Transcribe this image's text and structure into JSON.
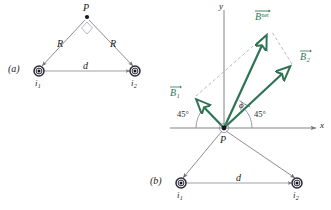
{
  "figure": {
    "panels": [
      {
        "id": "a",
        "label": "(a)",
        "point_label": "P",
        "distance_label": "d",
        "radius_label_left": "R",
        "radius_label_right": "R",
        "current_left": "i",
        "current_left_sub": "1",
        "current_right": "i",
        "current_right_sub": "2"
      },
      {
        "id": "b",
        "label": "(b)",
        "point_label": "P",
        "distance_label": "d",
        "current_left": "i",
        "current_left_sub": "1",
        "current_right": "i",
        "current_right_sub": "2",
        "axis_x": "x",
        "axis_y": "y",
        "angle_left": "45°",
        "angle_right": "45°",
        "angle_phi": "ϕ",
        "vectors": [
          {
            "name": "B",
            "sub": "1",
            "sup": "",
            "label_full": "B1"
          },
          {
            "name": "B",
            "sub": "2",
            "sup": "",
            "label_full": "B2"
          },
          {
            "name": "B",
            "sub": "",
            "sup": "net",
            "label_full": "Bnet"
          }
        ]
      }
    ],
    "colors": {
      "vector_green": "#2f7355",
      "line_gray": "#6e6e78",
      "dashed_gray": "#9a9aa6",
      "axis_gray": "#74747e",
      "text_black": "#1b1b1b",
      "marker_dark": "#2a2a38"
    }
  }
}
